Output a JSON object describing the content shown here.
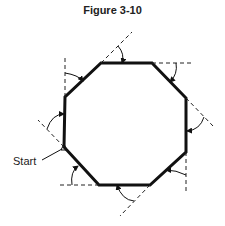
{
  "figure": {
    "title": "Figure 3-10",
    "start_label": "Start",
    "colors": {
      "stroke": "#111111",
      "background": "#ffffff"
    },
    "octagon_vertices": [
      [
        101,
        63
      ],
      [
        152,
        63
      ],
      [
        186,
        98
      ],
      [
        186,
        152
      ],
      [
        150,
        185
      ],
      [
        99,
        185
      ],
      [
        64,
        147
      ],
      [
        65,
        97
      ]
    ],
    "start_vertex": [
      64,
      147
    ],
    "turn_arrows_count": 8
  }
}
